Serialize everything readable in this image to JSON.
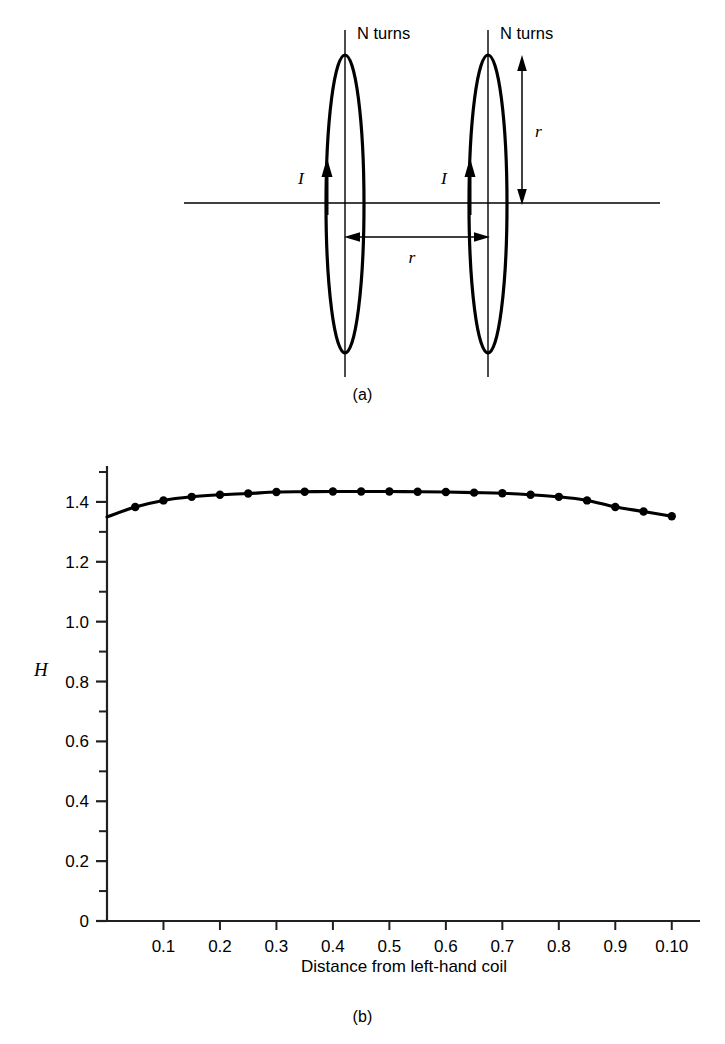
{
  "figure": {
    "panel_a": {
      "caption": "(a)",
      "labels": {
        "coil_left_turns": "N turns",
        "coil_right_turns": "N turns",
        "current_left": "I",
        "current_right": "I",
        "radius_vertical": "r",
        "separation_horizontal": "r"
      }
    },
    "panel_b": {
      "caption": "(b)"
    }
  },
  "chart_data": {
    "type": "line",
    "title": "",
    "xlabel": "Distance from left-hand coil",
    "ylabel": "H",
    "xlim": [
      0.0,
      0.105
    ],
    "ylim": [
      0,
      1.52
    ],
    "grid": false,
    "legend": null,
    "markers": "filled-circle",
    "x_tick_labels": [
      "0.1",
      "0.2",
      "0.3",
      "0.4",
      "0.5",
      "0.6",
      "0.7",
      "0.8",
      "0.9",
      "0.10"
    ],
    "x_tick_values": [
      0.01,
      0.02,
      0.03,
      0.04,
      0.05,
      0.06,
      0.07,
      0.08,
      0.09,
      0.1
    ],
    "y_tick_labels": [
      "0",
      "0.2",
      "0.4",
      "0.6",
      "0.8",
      "1.0",
      "1.2",
      "1.4"
    ],
    "y_tick_values": [
      0,
      0.2,
      0.4,
      0.6,
      0.8,
      1.0,
      1.2,
      1.4
    ],
    "y_minor_tick_values": [
      0.1,
      0.3,
      0.5,
      0.7,
      0.9,
      1.1,
      1.3,
      1.5
    ],
    "x": [
      0.0,
      0.005,
      0.01,
      0.015,
      0.02,
      0.025,
      0.03,
      0.035,
      0.04,
      0.045,
      0.05,
      0.055,
      0.06,
      0.065,
      0.07,
      0.075,
      0.08,
      0.085,
      0.09,
      0.095,
      0.1
    ],
    "values": [
      1.35,
      1.383,
      1.405,
      1.417,
      1.424,
      1.428,
      1.433,
      1.434,
      1.435,
      1.435,
      1.435,
      1.434,
      1.433,
      1.431,
      1.429,
      1.424,
      1.417,
      1.405,
      1.383,
      1.368,
      1.352
    ]
  }
}
